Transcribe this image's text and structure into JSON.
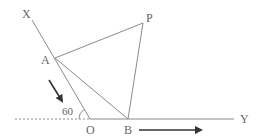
{
  "diagram": {
    "points": {
      "X": {
        "label": "X"
      },
      "A": {
        "label": "A"
      },
      "P": {
        "label": "P"
      },
      "O": {
        "label": "O"
      },
      "B": {
        "label": "B"
      },
      "Y": {
        "label": "Y"
      }
    },
    "angle": {
      "label": "60",
      "vertex": "O"
    },
    "segments": [
      "XO",
      "AP",
      "AB",
      "PB",
      "OY"
    ],
    "arrows": [
      {
        "along": "XA",
        "direction": "toward O"
      },
      {
        "along": "OY",
        "direction": "toward Y"
      }
    ],
    "colors": {
      "line": "#8a8a8a",
      "arrow": "#333333",
      "label": "#666666"
    }
  }
}
